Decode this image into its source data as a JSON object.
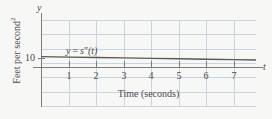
{
  "figure": {
    "width": 272,
    "height": 119,
    "background_color": "#f7f7f5",
    "grid_color": "#c9d4de",
    "axis_color": "#7d7d7d",
    "line_color": "#595959",
    "text_color": "#4a4a4a"
  },
  "labels": {
    "y_axis_name": "y",
    "x_axis_name": "t",
    "x_axis_title": "Time (seconds)",
    "y_axis_title_main": "Feet per second",
    "y_axis_title_exponent": "2",
    "curve_label_y": "y",
    "curve_label_equals": "=",
    "curve_label_s": "s",
    "curve_label_primes": "″",
    "curve_label_arg": "(t)"
  },
  "axes": {
    "x_ticks": [
      "1",
      "2",
      "3",
      "4",
      "5",
      "6",
      "7"
    ],
    "y_ticks": [
      "10"
    ]
  },
  "chart_data": {
    "type": "line",
    "title": "",
    "subtitle": "",
    "xlabel": "Time (seconds)",
    "ylabel": "Feet per second²",
    "xlim": [
      0,
      7.8
    ],
    "ylim": [
      0,
      16
    ],
    "grid": true,
    "legend": "none",
    "annotations": [
      {
        "text": "y = s″(t)",
        "x": 1.0,
        "y": 11.6,
        "description": "inline curve label for the acceleration function"
      },
      {
        "text": "y",
        "x": 0,
        "y": 16,
        "description": "vertical axis name"
      },
      {
        "text": "t",
        "x": 7.9,
        "y": 0,
        "description": "horizontal axis name"
      }
    ],
    "x_tick_values": [
      1,
      2,
      3,
      4,
      5,
      6,
      7
    ],
    "x_tick_labels": [
      "1",
      "2",
      "3",
      "4",
      "5",
      "6",
      "7"
    ],
    "y_tick_values": [
      10
    ],
    "y_tick_labels": [
      "10"
    ],
    "series": [
      {
        "name": "y = s″(t)",
        "color": "#595959",
        "x": [
          0,
          1,
          2,
          3,
          4,
          5,
          6,
          7,
          7.8
        ],
        "values": [
          11.5,
          11.0,
          10.5,
          10.1,
          9.6,
          9.1,
          8.6,
          8.2,
          7.8
        ]
      }
    ]
  }
}
